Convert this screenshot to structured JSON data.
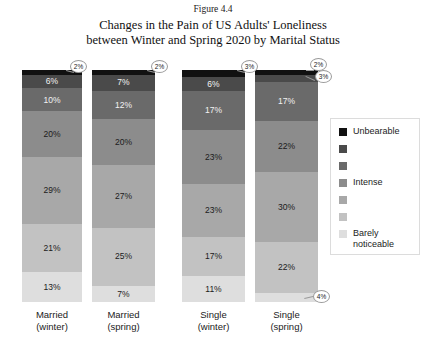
{
  "figure_number": "Figure 4.4",
  "title_line1": "Changes in the Pain of US Adults' Loneliness",
  "title_line2": "between Winter and Spring 2020 by Marital Status",
  "chart_data": {
    "type": "bar",
    "subtype": "100% stacked column",
    "title": "Changes in the Pain of US Adults' Loneliness between Winter and Spring 2020 by Marital Status",
    "xlabel": "",
    "ylabel": "",
    "ylim": [
      0,
      100
    ],
    "grid": false,
    "legend_position": "right",
    "stack_order": "top-to-bottom: Unbearable first, Barely noticeable last",
    "categories": [
      "Married (winter)",
      "Married (spring)",
      "Single (winter)",
      "Single (spring)"
    ],
    "category_lines": [
      [
        "Married",
        "(winter)"
      ],
      [
        "Married",
        "(spring)"
      ],
      [
        "Single",
        "(winter)"
      ],
      [
        "Single",
        "(spring)"
      ]
    ],
    "legend_entries": [
      {
        "label": "Unbearable",
        "color": "#111111",
        "labeled": true
      },
      {
        "label": "",
        "color": "#4a4a4a",
        "labeled": false
      },
      {
        "label": "",
        "color": "#6a6a6a",
        "labeled": false
      },
      {
        "label": "Intense",
        "color": "#8c8c8c",
        "labeled": true
      },
      {
        "label": "",
        "color": "#a8a8a8",
        "labeled": false
      },
      {
        "label": "",
        "color": "#c2c2c2",
        "labeled": false
      },
      {
        "label": "Barely\nnoticeable",
        "color": "#dedede",
        "labeled": true
      }
    ],
    "series": [
      {
        "name": "Unbearable",
        "color": "#111111",
        "values": [
          2,
          2,
          3,
          2
        ]
      },
      {
        "name": "Level 2",
        "color": "#4a4a4a",
        "values": [
          6,
          7,
          6,
          3
        ]
      },
      {
        "name": "Level 3",
        "color": "#6a6a6a",
        "values": [
          10,
          12,
          17,
          17
        ]
      },
      {
        "name": "Intense",
        "color": "#8c8c8c",
        "values": [
          20,
          20,
          23,
          22
        ]
      },
      {
        "name": "Level 5",
        "color": "#a8a8a8",
        "values": [
          29,
          27,
          23,
          30
        ]
      },
      {
        "name": "Level 6",
        "color": "#c2c2c2",
        "values": [
          21,
          25,
          17,
          22
        ]
      },
      {
        "name": "Barely noticeable",
        "color": "#dedede",
        "values": [
          13,
          7,
          11,
          4
        ]
      }
    ],
    "bars": [
      {
        "category": "Married (winter)",
        "segments": [
          {
            "value": 2,
            "label": "2%",
            "color": "#111111",
            "label_style": "callout"
          },
          {
            "value": 6,
            "label": "6%",
            "color": "#4a4a4a",
            "label_style": "inside-light"
          },
          {
            "value": 10,
            "label": "10%",
            "color": "#6a6a6a",
            "label_style": "inside-light"
          },
          {
            "value": 20,
            "label": "20%",
            "color": "#8c8c8c",
            "label_style": "inside-dark"
          },
          {
            "value": 29,
            "label": "29%",
            "color": "#a8a8a8",
            "label_style": "inside-dark"
          },
          {
            "value": 21,
            "label": "21%",
            "color": "#c2c2c2",
            "label_style": "inside-dark"
          },
          {
            "value": 13,
            "label": "13%",
            "color": "#dedede",
            "label_style": "inside-dark"
          }
        ]
      },
      {
        "category": "Married (spring)",
        "segments": [
          {
            "value": 2,
            "label": "2%",
            "color": "#111111",
            "label_style": "callout"
          },
          {
            "value": 7,
            "label": "7%",
            "color": "#4a4a4a",
            "label_style": "inside-light"
          },
          {
            "value": 12,
            "label": "12%",
            "color": "#6a6a6a",
            "label_style": "inside-light"
          },
          {
            "value": 20,
            "label": "20%",
            "color": "#8c8c8c",
            "label_style": "inside-dark"
          },
          {
            "value": 27,
            "label": "27%",
            "color": "#a8a8a8",
            "label_style": "inside-dark"
          },
          {
            "value": 25,
            "label": "25%",
            "color": "#c2c2c2",
            "label_style": "inside-dark"
          },
          {
            "value": 7,
            "label": "7%",
            "color": "#dedede",
            "label_style": "inside-dark"
          }
        ]
      },
      {
        "category": "Single (winter)",
        "segments": [
          {
            "value": 3,
            "label": "3%",
            "color": "#111111",
            "label_style": "callout"
          },
          {
            "value": 6,
            "label": "6%",
            "color": "#4a4a4a",
            "label_style": "inside-light"
          },
          {
            "value": 17,
            "label": "17%",
            "color": "#6a6a6a",
            "label_style": "inside-light"
          },
          {
            "value": 23,
            "label": "23%",
            "color": "#8c8c8c",
            "label_style": "inside-dark"
          },
          {
            "value": 23,
            "label": "23%",
            "color": "#a8a8a8",
            "label_style": "inside-dark"
          },
          {
            "value": 17,
            "label": "17%",
            "color": "#c2c2c2",
            "label_style": "inside-dark"
          },
          {
            "value": 11,
            "label": "11%",
            "color": "#dedede",
            "label_style": "inside-dark"
          }
        ]
      },
      {
        "category": "Single (spring)",
        "segments": [
          {
            "value": 2,
            "label": "2%",
            "color": "#111111",
            "label_style": "callout"
          },
          {
            "value": 3,
            "label": "3%",
            "color": "#4a4a4a",
            "label_style": "callout"
          },
          {
            "value": 17,
            "label": "17%",
            "color": "#6a6a6a",
            "label_style": "inside-light"
          },
          {
            "value": 22,
            "label": "22%",
            "color": "#8c8c8c",
            "label_style": "inside-dark"
          },
          {
            "value": 30,
            "label": "30%",
            "color": "#a8a8a8",
            "label_style": "inside-dark"
          },
          {
            "value": 22,
            "label": "22%",
            "color": "#c2c2c2",
            "label_style": "inside-dark"
          },
          {
            "value": 4,
            "label": "4%",
            "color": "#dedede",
            "label_style": "callout"
          }
        ]
      }
    ],
    "callouts": [
      {
        "bar": "Married (winter)",
        "label": "2%"
      },
      {
        "bar": "Married (spring)",
        "label": "2%"
      },
      {
        "bar": "Single (winter)",
        "label": "3%"
      },
      {
        "bar": "Single (spring)",
        "label": "2%"
      },
      {
        "bar": "Single (spring)",
        "label": "3%"
      },
      {
        "bar": "Single (spring)",
        "label": "4%"
      }
    ]
  }
}
